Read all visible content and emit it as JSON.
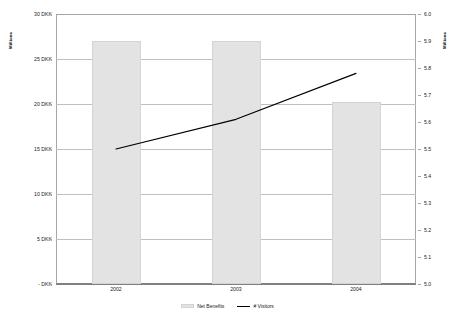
{
  "chart_data": {
    "type": "bar",
    "title": "",
    "categories": [
      "2002",
      "2003",
      "2004"
    ],
    "series": [
      {
        "name": "Net Benefits",
        "type": "bar",
        "axis": "left",
        "values": [
          27.0,
          27.0,
          20.2
        ]
      },
      {
        "name": "# Visitors",
        "type": "line",
        "axis": "right",
        "values": [
          5.5,
          5.61,
          5.78
        ]
      }
    ],
    "xlabel": "",
    "ylabel": "Millions",
    "y2label": "Millions",
    "ylim": [
      0,
      30
    ],
    "y2lim": [
      5.0,
      6.0
    ],
    "yticks": [
      "- DKK",
      "5 DKK",
      "10 DKK",
      "15 DKK",
      "20 DKK",
      "25 DKK",
      "30 DKK"
    ],
    "ytick_values": [
      0,
      5,
      10,
      15,
      20,
      25,
      30
    ],
    "y2ticks": [
      "5.0",
      "5.1",
      "5.2",
      "5.3",
      "5.4",
      "5.5",
      "5.6",
      "5.7",
      "5.8",
      "5.9",
      "6.0"
    ],
    "y2tick_values": [
      5.0,
      5.1,
      5.2,
      5.3,
      5.4,
      5.5,
      5.6,
      5.7,
      5.8,
      5.9,
      6.0
    ],
    "grid": true,
    "legend_position": "bottom",
    "colors": {
      "bar_fill": "#e3e3e3",
      "bar_edge": "#d4d4d4",
      "line": "#000000",
      "gridline": "#bfbfbf",
      "axis": "#a6a6a6",
      "text": "#222222",
      "background": "#ffffff"
    }
  },
  "axes": {
    "left_title": "Millions",
    "right_title": "Millions"
  },
  "legend": {
    "items": [
      {
        "label": "Net Benefits",
        "marker": "bar-swatch"
      },
      {
        "label": "# Visitors",
        "marker": "line-swatch"
      }
    ]
  }
}
